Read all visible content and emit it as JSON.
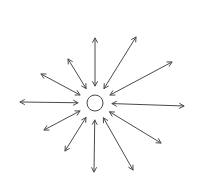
{
  "diagram": {
    "stroke_color": "#4a4a4a",
    "background": "#ffffff",
    "center": {
      "x": 95,
      "y": 103,
      "r": 8
    },
    "inner_radius": 17,
    "arrows": [
      {
        "x": 95,
        "y": 38
      },
      {
        "x": 136,
        "y": 37
      },
      {
        "x": 172,
        "y": 62
      },
      {
        "x": 184,
        "y": 106
      },
      {
        "x": 161,
        "y": 143
      },
      {
        "x": 133,
        "y": 170
      },
      {
        "x": 94,
        "y": 172
      },
      {
        "x": 65,
        "y": 151
      },
      {
        "x": 44,
        "y": 130
      },
      {
        "x": 20,
        "y": 102
      },
      {
        "x": 41,
        "y": 74
      },
      {
        "x": 68,
        "y": 59
      }
    ]
  }
}
